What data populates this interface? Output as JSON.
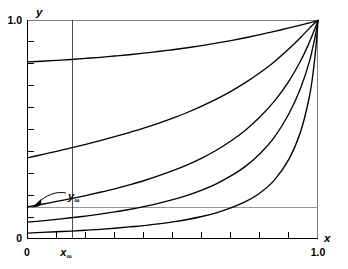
{
  "chart_data": {
    "type": "line",
    "title": "",
    "xlabel": "x",
    "ylabel": "y",
    "xlim": [
      0,
      1.0
    ],
    "ylim": [
      0,
      1.0
    ],
    "grid": false,
    "legend": null,
    "x_ticks": [
      {
        "value": 0,
        "label": "0",
        "major": true
      },
      {
        "value": 0.1,
        "label": "",
        "major": false
      },
      {
        "value": 0.2,
        "label": "",
        "major": false
      },
      {
        "value": 0.3,
        "label": "",
        "major": false
      },
      {
        "value": 0.4,
        "label": "",
        "major": false
      },
      {
        "value": 0.5,
        "label": "",
        "major": false
      },
      {
        "value": 0.6,
        "label": "",
        "major": false
      },
      {
        "value": 0.7,
        "label": "",
        "major": false
      },
      {
        "value": 0.8,
        "label": "",
        "major": false
      },
      {
        "value": 0.9,
        "label": "",
        "major": false
      },
      {
        "value": 1.0,
        "label": "1.0",
        "major": true
      }
    ],
    "y_ticks": [
      {
        "value": 0,
        "label": "0",
        "major": true
      },
      {
        "value": 0.1,
        "label": "",
        "major": false
      },
      {
        "value": 0.2,
        "label": "",
        "major": false
      },
      {
        "value": 0.3,
        "label": "",
        "major": false
      },
      {
        "value": 0.4,
        "label": "",
        "major": false
      },
      {
        "value": 0.5,
        "label": "",
        "major": false
      },
      {
        "value": 0.6,
        "label": "",
        "major": false
      },
      {
        "value": 0.7,
        "label": "",
        "major": false
      },
      {
        "value": 0.8,
        "label": "",
        "major": false
      },
      {
        "value": 0.9,
        "label": "",
        "major": false
      },
      {
        "value": 1.0,
        "label": "1.0",
        "major": true
      }
    ],
    "annotations": [
      {
        "name": "y-infinity",
        "text_main": "y",
        "text_sub": "∞",
        "label": "y∞",
        "value": 0.145,
        "arrow_from": [
          0.135,
          0.255
        ],
        "arrow_to": [
          0.012,
          0.165
        ],
        "kind": "pointer-label"
      },
      {
        "name": "x-infinity",
        "text_main": "x",
        "text_sub": "∞",
        "label": "x∞",
        "value": 0.155,
        "kind": "axis-label"
      }
    ],
    "reference_lines": [
      {
        "name": "y-infinity-line",
        "orientation": "horizontal",
        "value": 0.145
      },
      {
        "name": "x-infinity-line",
        "orientation": "vertical",
        "value": 0.155
      }
    ],
    "series": [
      {
        "name": "curve-1",
        "y_intercept": 0.81,
        "points": [
          [
            0.0,
            0.81
          ],
          [
            0.05,
            0.813
          ],
          [
            0.1,
            0.817
          ],
          [
            0.15,
            0.821
          ],
          [
            0.2,
            0.826
          ],
          [
            0.25,
            0.831
          ],
          [
            0.3,
            0.837
          ],
          [
            0.35,
            0.843
          ],
          [
            0.4,
            0.85
          ],
          [
            0.45,
            0.858
          ],
          [
            0.5,
            0.866
          ],
          [
            0.55,
            0.875
          ],
          [
            0.6,
            0.885
          ],
          [
            0.65,
            0.896
          ],
          [
            0.7,
            0.908
          ],
          [
            0.75,
            0.921
          ],
          [
            0.8,
            0.935
          ],
          [
            0.85,
            0.95
          ],
          [
            0.9,
            0.966
          ],
          [
            0.94,
            0.979
          ],
          [
            0.97,
            0.989
          ],
          [
            0.99,
            0.996
          ],
          [
            1.0,
            1.0
          ]
        ]
      },
      {
        "name": "curve-2",
        "y_intercept": 0.37,
        "points": [
          [
            0.0,
            0.37
          ],
          [
            0.05,
            0.385
          ],
          [
            0.1,
            0.4
          ],
          [
            0.15,
            0.416
          ],
          [
            0.2,
            0.432
          ],
          [
            0.25,
            0.449
          ],
          [
            0.3,
            0.467
          ],
          [
            0.35,
            0.486
          ],
          [
            0.4,
            0.506
          ],
          [
            0.45,
            0.528
          ],
          [
            0.5,
            0.552
          ],
          [
            0.55,
            0.578
          ],
          [
            0.6,
            0.607
          ],
          [
            0.65,
            0.639
          ],
          [
            0.7,
            0.675
          ],
          [
            0.75,
            0.715
          ],
          [
            0.8,
            0.76
          ],
          [
            0.85,
            0.811
          ],
          [
            0.9,
            0.87
          ],
          [
            0.94,
            0.922
          ],
          [
            0.97,
            0.964
          ],
          [
            0.99,
            0.99
          ],
          [
            1.0,
            1.0
          ]
        ]
      },
      {
        "name": "curve-3",
        "y_intercept": 0.145,
        "points": [
          [
            0.0,
            0.145
          ],
          [
            0.05,
            0.157
          ],
          [
            0.1,
            0.17
          ],
          [
            0.15,
            0.183
          ],
          [
            0.2,
            0.197
          ],
          [
            0.25,
            0.212
          ],
          [
            0.3,
            0.228
          ],
          [
            0.35,
            0.246
          ],
          [
            0.4,
            0.265
          ],
          [
            0.45,
            0.287
          ],
          [
            0.5,
            0.311
          ],
          [
            0.55,
            0.338
          ],
          [
            0.6,
            0.369
          ],
          [
            0.65,
            0.405
          ],
          [
            0.7,
            0.447
          ],
          [
            0.75,
            0.497
          ],
          [
            0.8,
            0.557
          ],
          [
            0.85,
            0.63
          ],
          [
            0.9,
            0.722
          ],
          [
            0.94,
            0.814
          ],
          [
            0.97,
            0.899
          ],
          [
            0.99,
            0.964
          ],
          [
            1.0,
            1.0
          ]
        ]
      },
      {
        "name": "curve-4",
        "y_intercept": 0.075,
        "points": [
          [
            0.0,
            0.075
          ],
          [
            0.05,
            0.081
          ],
          [
            0.1,
            0.088
          ],
          [
            0.15,
            0.095
          ],
          [
            0.2,
            0.103
          ],
          [
            0.25,
            0.112
          ],
          [
            0.3,
            0.122
          ],
          [
            0.35,
            0.133
          ],
          [
            0.4,
            0.146
          ],
          [
            0.45,
            0.161
          ],
          [
            0.5,
            0.178
          ],
          [
            0.55,
            0.198
          ],
          [
            0.6,
            0.222
          ],
          [
            0.65,
            0.251
          ],
          [
            0.7,
            0.287
          ],
          [
            0.75,
            0.331
          ],
          [
            0.8,
            0.389
          ],
          [
            0.85,
            0.465
          ],
          [
            0.9,
            0.572
          ],
          [
            0.94,
            0.689
          ],
          [
            0.97,
            0.81
          ],
          [
            0.99,
            0.925
          ],
          [
            1.0,
            1.0
          ]
        ]
      },
      {
        "name": "curve-5",
        "y_intercept": 0.025,
        "points": [
          [
            0.0,
            0.025
          ],
          [
            0.05,
            0.028
          ],
          [
            0.1,
            0.031
          ],
          [
            0.15,
            0.034
          ],
          [
            0.2,
            0.038
          ],
          [
            0.25,
            0.042
          ],
          [
            0.3,
            0.047
          ],
          [
            0.35,
            0.053
          ],
          [
            0.4,
            0.059
          ],
          [
            0.45,
            0.067
          ],
          [
            0.5,
            0.076
          ],
          [
            0.55,
            0.087
          ],
          [
            0.6,
            0.101
          ],
          [
            0.65,
            0.118
          ],
          [
            0.7,
            0.14
          ],
          [
            0.75,
            0.169
          ],
          [
            0.8,
            0.209
          ],
          [
            0.85,
            0.268
          ],
          [
            0.9,
            0.364
          ],
          [
            0.94,
            0.49
          ],
          [
            0.97,
            0.648
          ],
          [
            0.985,
            0.78
          ],
          [
            0.995,
            0.91
          ],
          [
            1.0,
            1.0
          ]
        ]
      }
    ]
  },
  "labels": {
    "y_axis": "y",
    "x_axis": "x",
    "y_max": "1.0",
    "y_min": "0",
    "x_max": "1.0",
    "x_min": "0",
    "y_infinity_main": "y",
    "y_infinity_sub": "∞",
    "x_infinity_main": "x",
    "x_infinity_sub": "∞"
  }
}
